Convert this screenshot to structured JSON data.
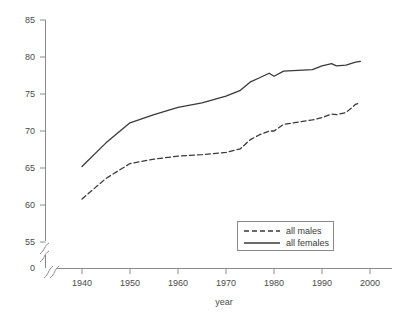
{
  "chart_data": {
    "type": "line",
    "title": "",
    "subtitle": "",
    "xlabel": "year",
    "ylabel": "",
    "xlim": [
      1935,
      2003
    ],
    "ylim": [
      55,
      85
    ],
    "y_axis_break": {
      "present": true,
      "from": 0,
      "to": 55,
      "zero_label": "0"
    },
    "x_axis_break": {
      "present": true
    },
    "grid": false,
    "legend_position": "inside-lower-right",
    "xticks": [
      1940,
      1950,
      1960,
      1970,
      1980,
      1990,
      2000
    ],
    "xtick_labels": [
      "1940",
      "1950",
      "1960",
      "1970",
      "1980",
      "1990",
      "2000"
    ],
    "yticks": [
      55,
      60,
      65,
      70,
      75,
      80,
      85
    ],
    "ytick_labels": [
      "55",
      "60",
      "65",
      "70",
      "75",
      "80",
      "85"
    ],
    "colors": {
      "line": "#3a3a3a",
      "axis": "#8a8a8a",
      "text": "#4a4a4a",
      "background": "#ffffff"
    },
    "series": [
      {
        "name": "all males",
        "style": "dashed",
        "x": [
          1940,
          1945,
          1950,
          1955,
          1960,
          1965,
          1970,
          1973,
          1975,
          1977,
          1979,
          1980,
          1982,
          1985,
          1988,
          1990,
          1992,
          1993,
          1995,
          1997,
          1998
        ],
        "values": [
          60.8,
          63.6,
          65.6,
          66.2,
          66.6,
          66.8,
          67.1,
          67.6,
          68.8,
          69.5,
          70.0,
          70.0,
          70.9,
          71.2,
          71.5,
          71.8,
          72.3,
          72.2,
          72.5,
          73.6,
          73.8
        ]
      },
      {
        "name": "all females",
        "style": "solid",
        "x": [
          1940,
          1945,
          1950,
          1955,
          1960,
          1965,
          1970,
          1973,
          1975,
          1977,
          1979,
          1980,
          1982,
          1985,
          1988,
          1990,
          1992,
          1993,
          1995,
          1997,
          1998
        ],
        "values": [
          65.2,
          68.4,
          71.1,
          72.2,
          73.2,
          73.8,
          74.7,
          75.5,
          76.6,
          77.2,
          77.8,
          77.4,
          78.1,
          78.2,
          78.3,
          78.8,
          79.1,
          78.8,
          78.9,
          79.3,
          79.4
        ]
      }
    ]
  },
  "legend": {
    "items": [
      {
        "label": "all males",
        "style": "dashed"
      },
      {
        "label": "all females",
        "style": "solid"
      }
    ]
  },
  "axis": {
    "x_title": "year",
    "y_zero_label": "0"
  }
}
